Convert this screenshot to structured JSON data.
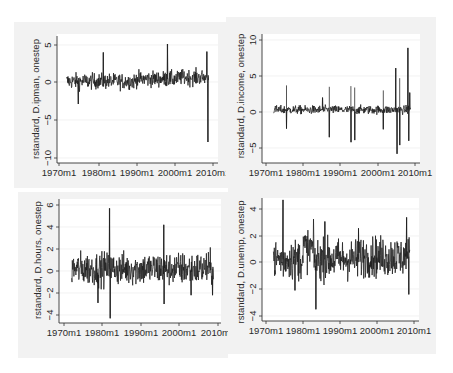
{
  "chart_data": [
    {
      "type": "line",
      "title": "",
      "xlabel": "",
      "ylabel": "rstandard, D.ipman, onestep",
      "x_ticks": [
        "1970m1",
        "1980m1",
        "1990m1",
        "2000m1",
        "2010m1"
      ],
      "y_ticks": [
        "5",
        "0",
        "-5",
        "-10"
      ],
      "y_tick_values": [
        5,
        0,
        -5,
        -10
      ],
      "xlim": [
        1970,
        2010
      ],
      "ylim": [
        -10.5,
        5.5
      ],
      "grid": true,
      "legend": null,
      "x_range_data": [
        1972,
        2008.8
      ],
      "annotations": [],
      "notable_points": [
        {
          "x": 1975.0,
          "y": -2.9
        },
        {
          "x": 1981.5,
          "y": 3.9
        },
        {
          "x": 1998.2,
          "y": 5.0
        },
        {
          "x": 2008.4,
          "y": 4.0
        },
        {
          "x": 2008.7,
          "y": -7.9
        }
      ],
      "typical_band": [
        -1.5,
        1.5
      ]
    },
    {
      "type": "line",
      "title": "",
      "xlabel": "",
      "ylabel": "rstandard, D.income, onestep",
      "x_ticks": [
        "1970m1",
        "1980m1",
        "1990m1",
        "2000m1",
        "2010m1"
      ],
      "y_ticks": [
        "10",
        "5",
        "0",
        "-5"
      ],
      "y_tick_values": [
        10,
        5,
        0,
        -5
      ],
      "xlim": [
        1970,
        2010
      ],
      "ylim": [
        -6.5,
        10.5
      ],
      "grid": true,
      "legend": null,
      "x_range_data": [
        1972,
        2008.8
      ],
      "notable_points": [
        {
          "x": 1975.5,
          "y": 3.7
        },
        {
          "x": 1975.5,
          "y": -2.3
        },
        {
          "x": 1985.2,
          "y": 2.0
        },
        {
          "x": 1987.0,
          "y": 3.5
        },
        {
          "x": 1987.0,
          "y": -3.5
        },
        {
          "x": 1992.8,
          "y": 3.6
        },
        {
          "x": 1992.8,
          "y": -4.2
        },
        {
          "x": 1993.8,
          "y": 3.4
        },
        {
          "x": 1993.8,
          "y": -3.9
        },
        {
          "x": 2001.5,
          "y": 3.0
        },
        {
          "x": 2001.5,
          "y": -2.4
        },
        {
          "x": 2004.8,
          "y": 6.1
        },
        {
          "x": 2005.2,
          "y": -5.8
        },
        {
          "x": 2005.9,
          "y": 4.7
        },
        {
          "x": 2005.9,
          "y": -4.6
        },
        {
          "x": 2008.1,
          "y": 8.9
        },
        {
          "x": 2008.3,
          "y": -4.0
        },
        {
          "x": 2008.6,
          "y": 2.7
        }
      ],
      "typical_band": [
        -0.7,
        1.0
      ]
    },
    {
      "type": "line",
      "title": "",
      "xlabel": "",
      "ylabel": "rstandard, D.hours, onestep",
      "x_ticks": [
        "1970m1",
        "1980m1",
        "1990m1",
        "2000m1",
        "2010m1"
      ],
      "y_ticks": [
        "6",
        "4",
        "2",
        "0",
        "-2",
        "-4"
      ],
      "y_tick_values": [
        6,
        4,
        2,
        0,
        -2,
        -4
      ],
      "xlim": [
        1970,
        2010
      ],
      "ylim": [
        -4.5,
        6.5
      ],
      "grid": true,
      "legend": null,
      "x_range_data": [
        1972,
        2008.8
      ],
      "notable_points": [
        {
          "x": 1978.8,
          "y": -2.9
        },
        {
          "x": 1981.8,
          "y": 5.7
        },
        {
          "x": 1982.0,
          "y": -4.3
        },
        {
          "x": 1995.9,
          "y": 4.2
        },
        {
          "x": 1996.0,
          "y": -3.0
        },
        {
          "x": 2003.0,
          "y": -2.2
        },
        {
          "x": 2008.6,
          "y": -2.2
        }
      ],
      "typical_band": [
        -1.8,
        2.5
      ]
    },
    {
      "type": "line",
      "title": "",
      "xlabel": "",
      "ylabel": "rstandard, D.unemp, onestep",
      "x_ticks": [
        "1970m1",
        "1980m1",
        "1990m1",
        "2000m1",
        "2010m1"
      ],
      "y_ticks": [
        "4",
        "2",
        "0",
        "-2",
        "-4"
      ],
      "y_tick_values": [
        4,
        2,
        0,
        -2,
        -4
      ],
      "xlim": [
        1970,
        2010
      ],
      "ylim": [
        -4.3,
        4.6
      ],
      "grid": true,
      "legend": null,
      "x_range_data": [
        1972,
        2008.8
      ],
      "notable_points": [
        {
          "x": 1974.6,
          "y": 4.6
        },
        {
          "x": 1977.8,
          "y": -2.1
        },
        {
          "x": 1983.5,
          "y": -3.5
        },
        {
          "x": 1985.9,
          "y": 3.0
        },
        {
          "x": 1995.0,
          "y": 2.5
        },
        {
          "x": 2008.0,
          "y": 3.3
        },
        {
          "x": 2008.6,
          "y": -2.4
        }
      ],
      "typical_band": [
        -1.8,
        2.5
      ]
    }
  ],
  "panels": [
    {
      "id": "ipman",
      "ylabel": "rstandard, D.ipman, onestep",
      "x_ticks": [
        "1970m1",
        "1980m1",
        "1990m1",
        "2000m1",
        "2010m1"
      ],
      "y_ticks": [
        "5",
        "0",
        "−5",
        "−10"
      ]
    },
    {
      "id": "income",
      "ylabel": "rstandard, D.income, onestep",
      "x_ticks": [
        "1970m1",
        "1980m1",
        "1990m1",
        "2000m1",
        "2010m1"
      ],
      "y_ticks": [
        "10",
        "5",
        "0",
        "−5"
      ]
    },
    {
      "id": "hours",
      "ylabel": "rstandard, D.hours, onestep",
      "x_ticks": [
        "1970m1",
        "1980m1",
        "1990m1",
        "2000m1",
        "2010m1"
      ],
      "y_ticks": [
        "6",
        "4",
        "2",
        "0",
        "−2",
        "−4"
      ]
    },
    {
      "id": "unemp",
      "ylabel": "rstandard, D.unemp, onestep",
      "x_ticks": [
        "1970m1",
        "1980m1",
        "1990m1",
        "2000m1",
        "2010m1"
      ],
      "y_ticks": [
        "4",
        "2",
        "0",
        "−2",
        "−4"
      ]
    }
  ],
  "colors": {
    "line": "#1c1c1c",
    "panel_background": "#f2f2f2",
    "plot_background": "#ffffff",
    "axis": "#333333",
    "text": "#2a2a2a"
  }
}
